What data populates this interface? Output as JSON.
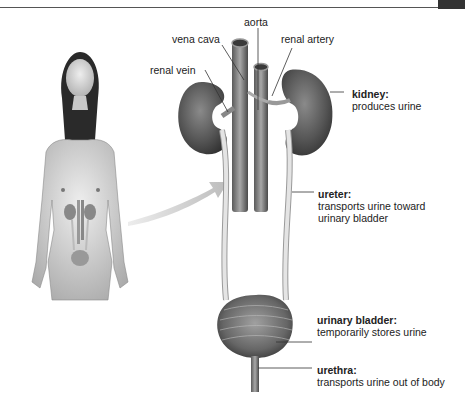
{
  "diagram": {
    "labels": {
      "aorta": "aorta",
      "vena_cava": "vena cava",
      "renal_artery": "renal artery",
      "renal_vein": "renal vein",
      "kidney": {
        "term": "kidney:",
        "desc": "produces urine"
      },
      "ureter": {
        "term": "ureter:",
        "desc1": "transports urine toward",
        "desc2": "urinary bladder"
      },
      "bladder": {
        "term": "urinary bladder:",
        "desc": "temporarily stores urine"
      },
      "urethra": {
        "term": "urethra:",
        "desc": "transports urine out of body"
      }
    },
    "colors": {
      "organ_dark": "#5a5a5a",
      "vessel": "#8a8a8a",
      "ureter": "#d8d8d8",
      "skin": "#d9d9d9",
      "arrow": "#cfcfcf"
    }
  }
}
